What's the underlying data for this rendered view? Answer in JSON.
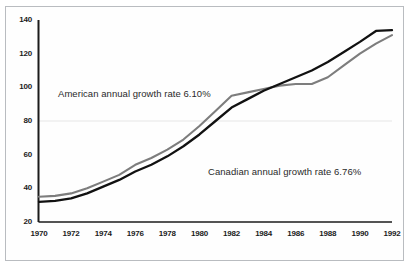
{
  "chart_data": {
    "type": "line",
    "title": "",
    "subtitle": "",
    "xlabel": "",
    "ylabel": "",
    "xlim": [
      1970,
      1992
    ],
    "ylim": [
      20,
      140
    ],
    "grid": true,
    "grid_lines_y": [
      80
    ],
    "legend_position": "inline-annotations",
    "x": [
      1970,
      1971,
      1972,
      1973,
      1974,
      1975,
      1976,
      1977,
      1978,
      1979,
      1980,
      1981,
      1982,
      1983,
      1984,
      1985,
      1986,
      1987,
      1988,
      1989,
      1990,
      1991,
      1992
    ],
    "xticks": [
      1970,
      1972,
      1974,
      1976,
      1978,
      1980,
      1982,
      1984,
      1986,
      1988,
      1990,
      1992
    ],
    "xtick_labels": [
      "1970",
      "1972",
      "1974",
      "1976",
      "1978",
      "1980",
      "1982",
      "1984",
      "1986",
      "1988",
      "1990",
      "1992"
    ],
    "yticks": [
      20,
      40,
      60,
      80,
      100,
      120,
      140
    ],
    "ytick_labels": [
      "20",
      "40",
      "60",
      "80",
      "100",
      "120",
      "140"
    ],
    "series": [
      {
        "name": "American annual growth rate",
        "rate": "6.10%",
        "color": "#7d7d7d",
        "annotation": "American annual growth rate 6.10%",
        "values": [
          35,
          35.5,
          37,
          40,
          44,
          48,
          54,
          58,
          63,
          69,
          77,
          86,
          95,
          97,
          99,
          101,
          102,
          102,
          106,
          113,
          120,
          126,
          131
        ]
      },
      {
        "name": "Canadian annual growth rate",
        "rate": "6.76%",
        "color": "#111111",
        "annotation": "Canadian annual growth rate 6.76%",
        "values": [
          32,
          32.5,
          34,
          37,
          41,
          45,
          50,
          54,
          59,
          65,
          72,
          80,
          88,
          93,
          98,
          102,
          106,
          110,
          115,
          121,
          127,
          133.5,
          134
        ]
      }
    ],
    "annotations": [
      {
        "text": "American annual growth rate 6.10%",
        "x_px": 58,
        "y_px": 88,
        "series": "American annual growth rate"
      },
      {
        "text": "Canadian annual growth rate 6.76%",
        "x_px": 208,
        "y_px": 166,
        "series": "Canadian annual growth rate"
      }
    ],
    "colors": {
      "american_line": "#7d7d7d",
      "canadian_line": "#111111",
      "axis": "#1b1b1b",
      "gridline": "#e6e6e6",
      "frame_border": "#b9bcc0",
      "background": "#ffffff"
    }
  }
}
